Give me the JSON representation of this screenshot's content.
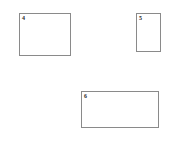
{
  "canvas": {
    "width": 171,
    "height": 142,
    "background_color": "#ffffff"
  },
  "style": {
    "border_color": "#8a8a8a",
    "border_width": 1,
    "fill_color": "#ffffff",
    "label_color": "#2b2b2b"
  },
  "shapes": [
    {
      "id": "rect-4",
      "label": "4",
      "shape": "rectangle",
      "orientation": "landscape",
      "x": 19,
      "y": 13,
      "width": 52,
      "height": 43
    },
    {
      "id": "rect-5",
      "label": "5",
      "shape": "rectangle",
      "orientation": "portrait",
      "x": 136,
      "y": 13,
      "width": 25,
      "height": 39
    },
    {
      "id": "rect-6",
      "label": "6",
      "shape": "rectangle",
      "orientation": "landscape",
      "x": 81,
      "y": 91,
      "width": 78,
      "height": 37
    }
  ]
}
